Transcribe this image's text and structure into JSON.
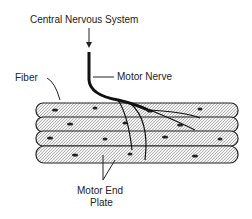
{
  "diagram": {
    "labels": {
      "cns": "Central Nervous System",
      "motor_nerve": "Motor Nerve",
      "fiber": "Fiber",
      "motor_end_plate_line1": "Motor End",
      "motor_end_plate_line2": "Plate"
    },
    "fiber_count": 4,
    "colors": {
      "ink": "#1a1a1a",
      "fiber_fill": "#e8e8e8",
      "background": "#ffffff"
    }
  }
}
